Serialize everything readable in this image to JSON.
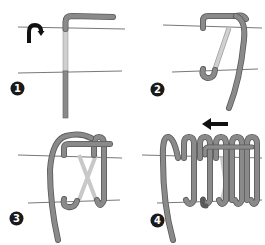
{
  "diagram": {
    "type": "step-by-step illustration",
    "colors": {
      "background": "#ffffff",
      "wire": "#8a8a8a",
      "wire_outline": "#5a5a5a",
      "wire_behind": "#c8c8c8",
      "guide_line": "#555555",
      "badge": "#1a1a1a",
      "badge_text": "#ffffff",
      "arrow": "#111111"
    },
    "steps": [
      {
        "number": "1",
        "note": "vertical wire, top bent to the right; curved rotate arrow on the left"
      },
      {
        "number": "2",
        "note": "wire wrapped over top line and hooked under bottom line, long tail down"
      },
      {
        "number": "3",
        "note": "second loop added, crossing segments behind (X)"
      },
      {
        "number": "4",
        "note": "multiple coil loops, arrow pointing left indicating wrap direction"
      }
    ],
    "icons": {
      "step1_arrow": "rotate-arrow-icon",
      "step4_arrow": "left-arrow-icon"
    }
  }
}
